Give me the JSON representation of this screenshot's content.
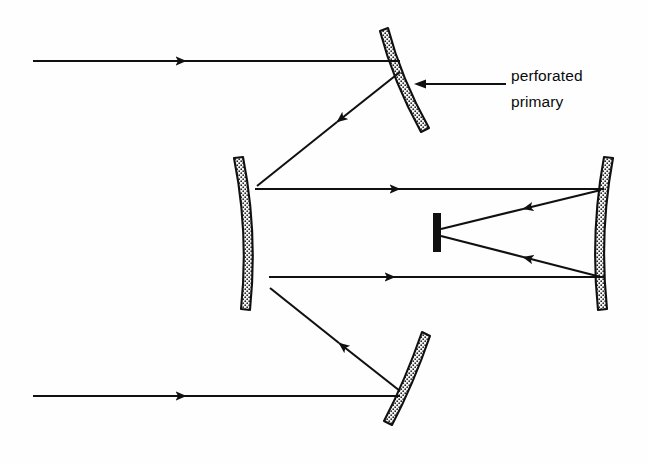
{
  "diagram": {
    "canvas": {
      "width": 648,
      "height": 464,
      "background": "#fefefe"
    },
    "annotation": {
      "line1": "perforated",
      "line2": "primary",
      "leader_from": [
        506,
        84
      ],
      "leader_to": [
        417,
        84
      ]
    },
    "colors": {
      "ink": "#101010",
      "mirror_fill": "#f2f2f2",
      "mirror_stipple": "#1a1a1a"
    },
    "mirrors": [
      {
        "name": "perforated-primary-upper",
        "role": "primary",
        "orientation": "tilted",
        "span": [
          [
            388,
            28
          ],
          [
            430,
            129
          ]
        ]
      },
      {
        "name": "perforated-primary-lower",
        "role": "primary",
        "orientation": "tilted",
        "span": [
          [
            430,
            336
          ],
          [
            392,
            426
          ]
        ]
      },
      {
        "name": "secondary-left",
        "role": "secondary",
        "orientation": "concave-right",
        "span": [
          [
            243,
            157
          ],
          [
            250,
            310
          ]
        ]
      },
      {
        "name": "tertiary-right",
        "role": "tertiary",
        "orientation": "concave-left",
        "span": [
          [
            604,
            157
          ],
          [
            608,
            310
          ]
        ]
      }
    ],
    "detector": {
      "name": "focal-plane-stop",
      "x": 437,
      "y_top": 213,
      "y_bottom": 252
    },
    "rays": [
      {
        "name": "incoming-ray-top",
        "from": [
          33,
          61
        ],
        "to": [
          399,
          61
        ],
        "arrow_at": [
          183,
          61
        ],
        "direction": "right"
      },
      {
        "name": "incoming-ray-bottom",
        "from": [
          33,
          396
        ],
        "to": [
          399,
          396
        ],
        "arrow_at": [
          183,
          396
        ],
        "direction": "right"
      },
      {
        "name": "primary-to-secondary-top",
        "from": [
          400,
          72
        ],
        "to": [
          258,
          186
        ],
        "arrow_at": [
          336,
          119
        ],
        "direction": "down-left"
      },
      {
        "name": "primary-to-secondary-bottom",
        "from": [
          400,
          391
        ],
        "to": [
          271,
          288
        ],
        "arrow_at": [
          337,
          345
        ],
        "direction": "up-left"
      },
      {
        "name": "secondary-to-tertiary-top",
        "from": [
          256,
          189
        ],
        "to": [
          604,
          189
        ],
        "arrow_at": [
          397,
          189
        ],
        "direction": "right"
      },
      {
        "name": "secondary-to-tertiary-bottom",
        "from": [
          270,
          277
        ],
        "to": [
          604,
          277
        ],
        "arrow_at": [
          392,
          277
        ],
        "direction": "right"
      },
      {
        "name": "tertiary-to-focus-top",
        "from": [
          601,
          190
        ],
        "to": [
          441,
          229
        ],
        "arrow_at": [
          521,
          210
        ],
        "direction": "left-down"
      },
      {
        "name": "tertiary-to-focus-bottom",
        "from": [
          601,
          277
        ],
        "to": [
          441,
          236
        ],
        "arrow_at": [
          521,
          257
        ],
        "direction": "left-up"
      }
    ]
  }
}
